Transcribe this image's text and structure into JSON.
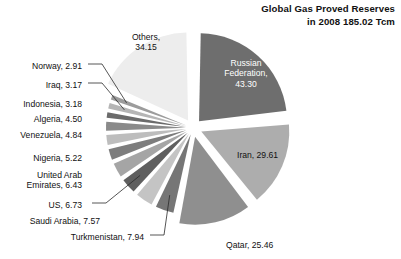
{
  "chart_data": {
    "type": "pie",
    "title": "Global Gas Proved Reserves in 2008 185.02 Tcm",
    "title_line1": "Global Gas Proved Reserves",
    "title_line2": "in 2008 185.02 Tcm",
    "unit": "Tcm",
    "total": 185.02,
    "exploded": true,
    "legend": "none",
    "categories": [
      "Russian Federation",
      "Iran",
      "Qatar",
      "Turkmenistan",
      "Saudi Arabia",
      "US",
      "United Arab Emirates",
      "Nigeria",
      "Venezuela",
      "Algeria",
      "Indonesia",
      "Iraq",
      "Norway",
      "Others"
    ],
    "values": [
      43.3,
      29.61,
      25.46,
      7.94,
      7.57,
      6.73,
      6.43,
      5.22,
      4.84,
      4.5,
      3.18,
      3.17,
      2.91,
      34.15
    ],
    "slice_colors": [
      "#6e6e6e",
      "#adadad",
      "#8f8f8f",
      "#767676",
      "#c4c4c4",
      "#5f5f5f",
      "#a5a5a5",
      "#7d7d7d",
      "#bdbdbd",
      "#8a8a8a",
      "#6b6b6b",
      "#b5b5b5",
      "#9c9c9c",
      "#ededed"
    ],
    "slice_labels": [
      "Russian Federation, 43.30",
      "Iran, 29.61",
      "Qatar, 25.46",
      "Turkmenistan, 7.94",
      "Saudi Arabia, 7.57",
      "US, 6.73",
      "United Arab Emirates, 6.43",
      "Nigeria, 5.22",
      "Venezuela, 4.84",
      "Algeria, 4.50",
      "Indonesia, 3.18",
      "Iraq, 3.17",
      "Norway, 2.91",
      "Others, 34.15"
    ]
  },
  "labels": {
    "russia_l1": "Russian",
    "russia_l2": "Federation,",
    "russia_l3": "43.30",
    "iran": "Iran, 29.61",
    "qatar": "Qatar, 25.46",
    "turkmenistan": "Turkmenistan, 7.94",
    "saudi": "Saudi Arabia, 7.57",
    "us": "US, 6.73",
    "uae_l1": "United Arab",
    "uae_l2": "Emirates, 6.43",
    "nigeria": "Nigeria, 5.22",
    "venezuela": "Venezuela, 4.84",
    "algeria": "Algeria, 4.50",
    "indonesia": "Indonesia, 3.18",
    "iraq": "Iraq, 3.17",
    "norway": "Norway, 2.91",
    "others_l1": "Others,",
    "others_l2": "34.15"
  }
}
